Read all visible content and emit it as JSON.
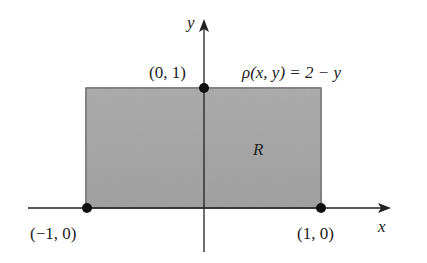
{
  "diagram": {
    "type": "region-plot",
    "region": {
      "label": "R",
      "x_range": [
        -1,
        1
      ],
      "y_range": [
        0,
        1
      ],
      "fill_color": "#a9a9a9"
    },
    "density_label": "ρ(x, y) = 2 − y",
    "axes": {
      "x_label": "x",
      "y_label": "y"
    },
    "points": [
      {
        "label": "(0, 1)",
        "x": 0,
        "y": 1
      },
      {
        "label": "(−1, 0)",
        "x": -1,
        "y": 0
      },
      {
        "label": "(1, 0)",
        "x": 1,
        "y": 0
      }
    ]
  }
}
